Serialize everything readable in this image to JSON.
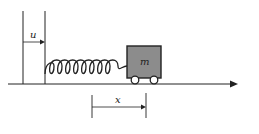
{
  "diagram": {
    "type": "mass-spring system on moving base",
    "labels": {
      "u": "u",
      "mass": "m",
      "x": "x"
    },
    "colors": {
      "line": "#222222",
      "mass_fill": "#8c8c8c",
      "background": "#ffffff"
    },
    "elements": [
      "fixed reference wall",
      "moving base wall",
      "displacement arrow u",
      "coil spring",
      "cart mass m with two wheels",
      "horizontal axis arrow",
      "displacement arrow x"
    ]
  }
}
